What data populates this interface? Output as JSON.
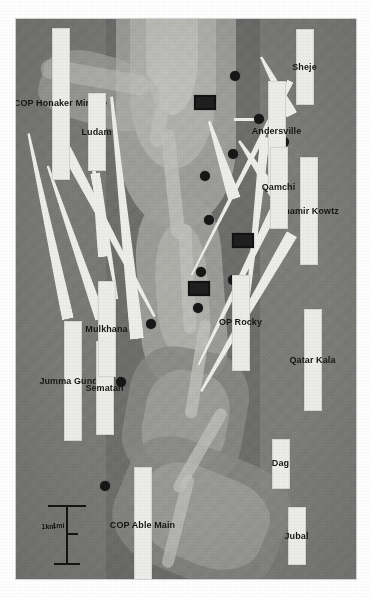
{
  "map": {
    "title": "Valley operations map",
    "orientation_deg": 90,
    "background_color": "#7e7e7c",
    "label_box_color": "#f1f1ed",
    "marker_color": "#131313",
    "scale_bar": {
      "units": [
        "1mi",
        "1km"
      ],
      "mi_label": "1mi",
      "km_label": "1km"
    },
    "legend": {
      "village_marker": "filled-circle",
      "outpost_marker": "filled-rectangle"
    },
    "labels": [
      {
        "id": "sheje",
        "text": "Sheje",
        "type": "village"
      },
      {
        "id": "andersville",
        "text": "Andersville",
        "type": "outpost"
      },
      {
        "id": "shamir-kowtz",
        "text": "Shamir Kowtz",
        "type": "village"
      },
      {
        "id": "qamchi",
        "text": "Qamchi",
        "type": "village"
      },
      {
        "id": "cop-honaker",
        "text": "COP Honaker Miracle",
        "type": "outpost"
      },
      {
        "id": "ludam",
        "text": "Ludam",
        "type": "village"
      },
      {
        "id": "qatar-kala",
        "text": "Qatar Kala",
        "type": "village"
      },
      {
        "id": "op-rocky",
        "text": "OP Rocky",
        "type": "outpost"
      },
      {
        "id": "jumma-gundai",
        "text": "Jumma Gundai",
        "type": "village"
      },
      {
        "id": "sematan",
        "text": "Sematan",
        "type": "village"
      },
      {
        "id": "mulkhana",
        "text": "Mulkhana",
        "type": "village"
      },
      {
        "id": "dag",
        "text": "Dag",
        "type": "village"
      },
      {
        "id": "jubal",
        "text": "Jubal",
        "type": "village"
      },
      {
        "id": "cop-able-main",
        "text": "COP Able Main",
        "type": "outpost"
      }
    ]
  }
}
